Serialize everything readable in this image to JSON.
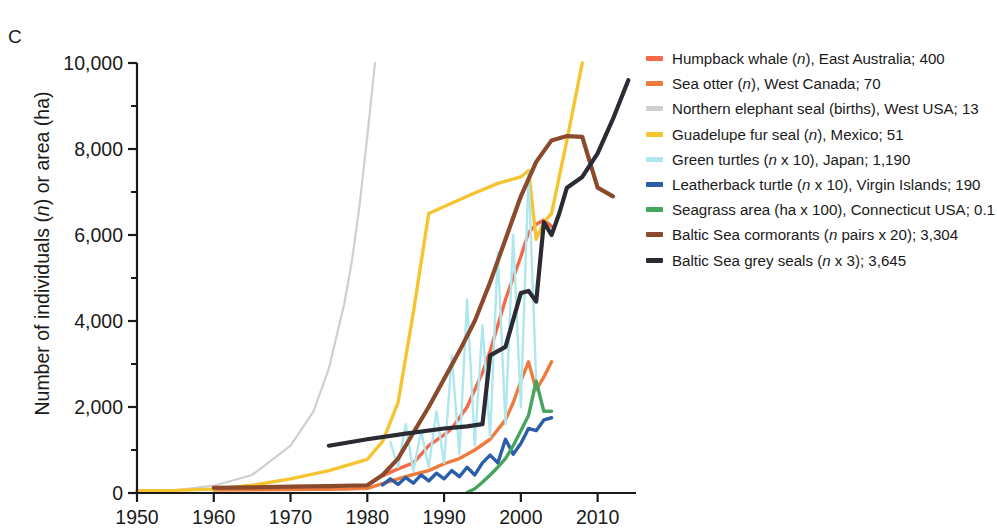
{
  "panel": {
    "label": "C"
  },
  "axes": {
    "ylabel_pre": "Number of individuals (",
    "ylabel_italic": "n",
    "ylabel_post": ") or area (ha)",
    "ylabel_full": "Number of individuals (n) or area (ha)",
    "yticks": [
      "0",
      "2,000",
      "4,000",
      "6,000",
      "8,000",
      "10,000"
    ],
    "xticks": [
      "1950",
      "1960",
      "1970",
      "1980",
      "1990",
      "2000",
      "2010"
    ]
  },
  "legend": {
    "items": [
      {
        "label": "Humpback whale (n), East Australia; 400",
        "pre": "Humpback whale (",
        "it": "n",
        "post": "), East Australia; 400",
        "color": "#F4694A"
      },
      {
        "label": "Sea otter (n), West Canada; 70",
        "pre": "Sea otter (",
        "it": "n",
        "post": "), West Canada; 70",
        "color": "#EE7B3C"
      },
      {
        "label": "Northern elephant seal (births), West USA; 13",
        "pre": "Northern elephant seal (births), West USA; 13",
        "it": "",
        "post": "",
        "color": "#CFCFCF"
      },
      {
        "label": "Guadelupe fur seal (n), Mexico; 51",
        "pre": "Guadelupe fur seal (",
        "it": "n",
        "post": "), Mexico; 51",
        "color": "#F5C430"
      },
      {
        "label": "Green turtles (n x 10), Japan; 1,190",
        "pre": "Green turtles (",
        "it": "n",
        "post": " x 10), Japan; 1,190",
        "color": "#AEE8EE"
      },
      {
        "label": "Leatherback turtle (n x 10), Virgin Islands; 190",
        "pre": "Leatherback turtle (",
        "it": "n",
        "post": " x 10), Virgin Islands; 190",
        "color": "#2A5FA8"
      },
      {
        "label": "Seagrass area (ha x 100), Connecticut USA; 0.1",
        "pre": "Seagrass area (ha x 100), Connecticut USA; 0.1",
        "it": "",
        "post": "",
        "color": "#45A55E"
      },
      {
        "label": "Baltic Sea cormorants (n pairs x 20); 3,304",
        "pre": "Baltic Sea cormorants (",
        "it": "n",
        "post": " pairs x 20); 3,304",
        "color": "#8B4A2B"
      },
      {
        "label": "Baltic Sea grey seals (n x 3); 3,645",
        "pre": "Baltic Sea grey seals (",
        "it": "n",
        "post": " x 3); 3,645",
        "color": "#2B2B33"
      }
    ]
  },
  "chart_data": {
    "type": "line",
    "title": "",
    "xlabel": "",
    "ylabel": "Number of individuals (n) or area (ha)",
    "xlim": [
      1950,
      2015
    ],
    "ylim": [
      0,
      10000
    ],
    "grid": false,
    "legend_position": "right",
    "ytick_values": [
      0,
      2000,
      4000,
      6000,
      8000,
      10000
    ],
    "ytick_minor_values": [
      1000,
      3000,
      5000,
      7000,
      9000
    ],
    "xtick_values": [
      1950,
      1960,
      1970,
      1980,
      1990,
      2000,
      2010
    ],
    "series": [
      {
        "name": "Humpback whale (n), East Australia; 400",
        "color": "#F4694A",
        "x": [
          1982,
          1984,
          1986,
          1987,
          1988,
          1990,
          1991,
          1992,
          1993,
          1994,
          1995,
          1996,
          1997,
          1998,
          1999,
          2000,
          2001,
          2002,
          2003,
          2004
        ],
        "y": [
          400,
          560,
          700,
          900,
          1100,
          1350,
          1500,
          1750,
          2000,
          2400,
          2800,
          3300,
          3900,
          4500,
          5000,
          5500,
          6050,
          6250,
          6350,
          6200
        ]
      },
      {
        "name": "Sea otter (n), West Canada; 70",
        "color": "#EE7B3C",
        "x": [
          1960,
          1970,
          1977,
          1980,
          1982,
          1984,
          1986,
          1988,
          1990,
          1992,
          1994,
          1996,
          1998,
          1999,
          2000,
          2001,
          2002,
          2003,
          2004
        ],
        "y": [
          70,
          80,
          90,
          110,
          220,
          330,
          430,
          520,
          680,
          800,
          1000,
          1250,
          1700,
          2100,
          2600,
          3050,
          2400,
          2700,
          3050
        ]
      },
      {
        "name": "Northern elephant seal (births), West USA; 13",
        "color": "#CFCFCF",
        "x": [
          1950,
          1955,
          1960,
          1965,
          1970,
          1973,
          1975,
          1977,
          1978,
          1979,
          1980,
          1981
        ],
        "y": [
          13,
          60,
          170,
          420,
          1100,
          1900,
          2900,
          4400,
          5400,
          6700,
          8300,
          10000
        ]
      },
      {
        "name": "Guadelupe fur seal (n), Mexico; 51",
        "color": "#F5C430",
        "x": [
          1950,
          1955,
          1960,
          1965,
          1970,
          1975,
          1980,
          1982,
          1984,
          1986,
          1988,
          1993,
          1997,
          2000,
          2001,
          2002,
          2003,
          2004,
          2006,
          2008
        ],
        "y": [
          51,
          60,
          90,
          180,
          330,
          520,
          780,
          1200,
          2100,
          4200,
          6500,
          6900,
          7200,
          7350,
          7500,
          5900,
          6300,
          6500,
          8200,
          10000
        ]
      },
      {
        "name": "Green turtles (n x 10), Japan; 1,190",
        "color": "#AEE8EE",
        "x": [
          1983,
          1984,
          1985,
          1986,
          1987,
          1988,
          1989,
          1990,
          1991,
          1992,
          1993,
          1994,
          1995,
          1996,
          1997,
          1998,
          1999,
          2000,
          2001,
          2002
        ],
        "y": [
          1190,
          600,
          1600,
          500,
          1450,
          600,
          1900,
          700,
          3200,
          900,
          4500,
          1100,
          3900,
          1300,
          5600,
          1600,
          6000,
          2000,
          7450,
          2600
        ]
      },
      {
        "name": "Leatherback turtle (n x 10), Virgin Islands; 190",
        "color": "#2A5FA8",
        "x": [
          1982,
          1983,
          1984,
          1985,
          1986,
          1987,
          1988,
          1989,
          1990,
          1991,
          1992,
          1993,
          1994,
          1995,
          1996,
          1997,
          1998,
          1999,
          2000,
          2001,
          2002,
          2003,
          2004
        ],
        "y": [
          190,
          330,
          200,
          360,
          230,
          420,
          280,
          460,
          330,
          520,
          380,
          600,
          420,
          700,
          880,
          700,
          1250,
          900,
          1150,
          1500,
          1450,
          1700,
          1750
        ]
      },
      {
        "name": "Seagrass area (ha x 100), Connecticut USA; 0.1",
        "color": "#45A55E",
        "x": [
          1993,
          1994,
          1995,
          1996,
          1997,
          1998,
          1999,
          2000,
          2001,
          2002,
          2003,
          2004
        ],
        "y": [
          10,
          100,
          250,
          420,
          600,
          800,
          1100,
          1450,
          1800,
          2600,
          1900,
          1900
        ]
      },
      {
        "name": "Baltic Sea cormorants (n pairs x 20); 3,304",
        "color": "#8B4A2B",
        "x": [
          1960,
          1965,
          1970,
          1975,
          1980,
          1982,
          1984,
          1986,
          1988,
          1990,
          1992,
          1994,
          1996,
          1998,
          2000,
          2002,
          2004,
          2006,
          2008,
          2010,
          2012
        ],
        "y": [
          120,
          130,
          150,
          160,
          180,
          420,
          800,
          1400,
          2000,
          2650,
          3300,
          4000,
          4900,
          5900,
          6900,
          7700,
          8200,
          8300,
          8280,
          7100,
          6900
        ]
      },
      {
        "name": "Baltic Sea grey seals (n x 3); 3,645",
        "color": "#2B2B33",
        "x": [
          1975,
          1980,
          1985,
          1990,
          1993,
          1995,
          1996,
          1998,
          2000,
          2001,
          2002,
          2003,
          2004,
          2005,
          2006,
          2008,
          2010,
          2012,
          2014
        ],
        "y": [
          1100,
          1250,
          1380,
          1500,
          1550,
          1600,
          3200,
          3400,
          4650,
          4700,
          4450,
          6300,
          6000,
          6500,
          7100,
          7350,
          7900,
          8700,
          9600
        ]
      }
    ]
  }
}
